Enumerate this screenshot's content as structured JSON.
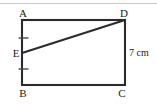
{
  "figure": {
    "type": "geometry-diagram",
    "shape": "rectangle-with-diagonal",
    "background_color": "#ffffff",
    "stroke_color": "#2b2b2b",
    "tick_color": "#4a4a4a",
    "rule_color": "#c9c9c9",
    "width": 157,
    "height": 105
  },
  "top_rule": {
    "name": "horizontal-divider",
    "x1": 0,
    "y1": 3.5,
    "x2": 157,
    "y2": 3.5,
    "color": "#c9c9c9",
    "stroke_width": 1.2
  },
  "rectangle": {
    "left": 22,
    "top": 20,
    "right": 125,
    "bottom": 85,
    "stroke_width": 2.1
  },
  "diagonal": {
    "name": "segment-ED",
    "from": "E",
    "to": "D",
    "x1": 22,
    "y1": 53,
    "x2": 125,
    "y2": 20,
    "stroke_width": 2.1
  },
  "ticks": [
    {
      "name": "tick-AE",
      "cx": 23.5,
      "cy": 38,
      "half_width": 5,
      "stroke_width": 1.4
    },
    {
      "name": "tick-EB",
      "cx": 23.5,
      "cy": 69,
      "half_width": 5,
      "stroke_width": 1.4
    }
  ],
  "points": [
    {
      "id": "A",
      "label": "A",
      "corner": "top-left",
      "label_x": 23,
      "label_y": 17,
      "anchor": "middle"
    },
    {
      "id": "D",
      "label": "D",
      "corner": "top-right",
      "label_x": 124,
      "label_y": 17,
      "anchor": "middle"
    },
    {
      "id": "B",
      "label": "B",
      "corner": "bottom-left",
      "label_x": 23,
      "label_y": 97,
      "anchor": "middle"
    },
    {
      "id": "C",
      "label": "C",
      "corner": "bottom-right",
      "label_x": 122,
      "label_y": 97,
      "anchor": "middle"
    },
    {
      "id": "E",
      "label": "E",
      "corner": "left-mid",
      "label_x": 16,
      "label_y": 56.5,
      "anchor": "middle"
    }
  ],
  "measurements": [
    {
      "id": "DC",
      "text": "7 cm",
      "value": 7,
      "unit": "cm",
      "applies_to": "segment-DC",
      "label_x": 129,
      "label_y": 56,
      "anchor": "start"
    }
  ]
}
